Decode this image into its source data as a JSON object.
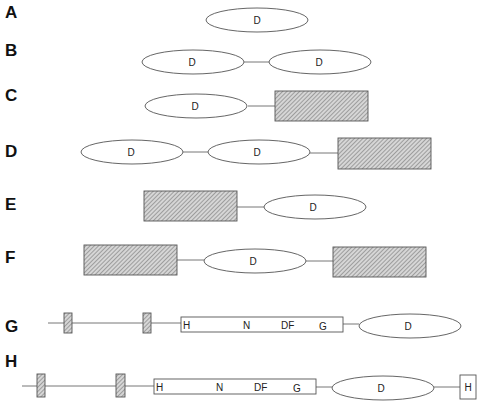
{
  "figure": {
    "rows": [
      {
        "label": "A",
        "domains": [
          "D"
        ]
      },
      {
        "label": "B",
        "domains": [
          "D",
          "D"
        ]
      },
      {
        "label": "C",
        "domains": [
          "D",
          "hatched-box"
        ]
      },
      {
        "label": "D",
        "domains": [
          "D",
          "D",
          "hatched-box"
        ]
      },
      {
        "label": "E",
        "domains": [
          "hatched-box",
          "D"
        ]
      },
      {
        "label": "F",
        "domains": [
          "hatched-box",
          "D",
          "hatched-box"
        ]
      },
      {
        "label": "G",
        "domains": [
          "tm-segment",
          "tm-segment",
          "kinase-box",
          "D"
        ],
        "kinase_box_letters": [
          "H",
          "N",
          "DF",
          "G"
        ]
      },
      {
        "label": "H",
        "domains": [
          "tm-segment",
          "tm-segment",
          "kinase-box",
          "D",
          "H-box"
        ],
        "kinase_box_letters": [
          "H",
          "N",
          "DF",
          "G"
        ],
        "end_box_letter": "H"
      }
    ],
    "labels": {
      "A": "A",
      "B": "B",
      "C": "C",
      "D": "D",
      "E": "E",
      "F": "F",
      "G": "G",
      "H": "H",
      "domain": "D",
      "kinase_H": "H",
      "kinase_N": "N",
      "kinase_DF": "DF",
      "kinase_G": "G",
      "end_H": "H"
    }
  }
}
